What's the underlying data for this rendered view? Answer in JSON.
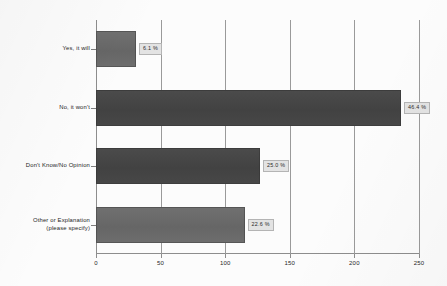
{
  "chart_data": {
    "type": "bar",
    "orientation": "horizontal",
    "title": "",
    "subtitle": "",
    "xlabel": "",
    "ylabel": "",
    "categories": [
      "Yes, it will",
      "No, it won't",
      "Don't Know/No Opinion",
      "Other or Explanation\n(please specify)"
    ],
    "category_lines": [
      [
        "Yes, it will"
      ],
      [
        "No, it won't"
      ],
      [
        "Don't Know/No Opinion"
      ],
      [
        "Other or Explanation",
        "(please specify)"
      ]
    ],
    "values": [
      31,
      236,
      127,
      115
    ],
    "data_labels": [
      "6.1 %",
      "46.4 %",
      "25.0 %",
      "22.6 %"
    ],
    "percentages": [
      6.1,
      46.4,
      25.0,
      22.6
    ],
    "xlim": [
      0,
      250
    ],
    "xticks": [
      0,
      50,
      100,
      150,
      200,
      250
    ],
    "xtick_labels": [
      "0",
      "50",
      "100",
      "150",
      "200",
      "250"
    ],
    "grid": true,
    "grid_axis": "x",
    "legend": false,
    "legend_position": "none",
    "bar_shades": [
      "light",
      "dark",
      "dark",
      "light"
    ],
    "colors": {
      "bar_light": "#6b6b6b",
      "bar_dark": "#464646",
      "axis": "#8d8d8d",
      "gridline": "#9a9a9a",
      "label_box_fill": "#e3e3e3",
      "label_box_border": "#b4b4b4",
      "text": "#1e1e1e",
      "background": "#fcfcfc"
    }
  }
}
